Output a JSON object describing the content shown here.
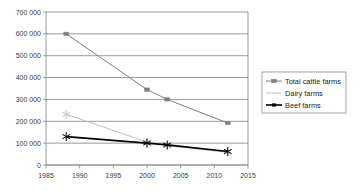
{
  "chart_data": {
    "type": "line",
    "title": "",
    "xlabel": "",
    "ylabel": "",
    "x": [
      1988,
      2000,
      2003,
      2012
    ],
    "xlim": [
      1985,
      2015
    ],
    "ylim": [
      0,
      700000
    ],
    "grid": true,
    "legend_position": "right",
    "xticks": [
      "1985",
      "1990",
      "1995",
      "2000",
      "2005",
      "2010",
      "2015"
    ],
    "xtick_values": [
      1985,
      1990,
      1995,
      2000,
      2005,
      2010,
      2015
    ],
    "yticks": [
      "0",
      "100 000",
      "200 000",
      "300 000",
      "400 000",
      "500 000",
      "600 000",
      "700 000"
    ],
    "ytick_values": [
      0,
      100000,
      200000,
      300000,
      400000,
      500000,
      600000,
      700000
    ],
    "series": [
      {
        "name": "Total cattle farms",
        "color": "#7f7f7f",
        "marker": "square",
        "values": [
          600000,
          345000,
          300000,
          192000
        ]
      },
      {
        "name": "Dairy farms",
        "color": "#bfbfbf",
        "marker": "star",
        "values": [
          232000,
          105000,
          88000,
          58000
        ]
      },
      {
        "name": "Beef farms",
        "color": "#000000",
        "marker": "star",
        "values": [
          130000,
          100000,
          92000,
          62000
        ]
      }
    ]
  },
  "legend": {
    "items": [
      {
        "label": "Total cattle farms"
      },
      {
        "label": "Dairy farms"
      },
      {
        "label": "Beef farms"
      }
    ]
  }
}
